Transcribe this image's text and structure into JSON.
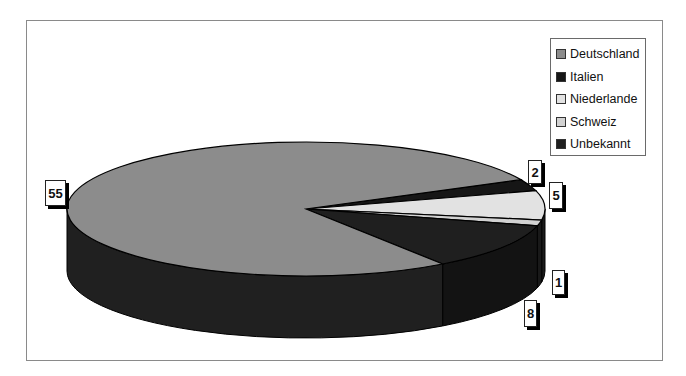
{
  "chart_data": {
    "type": "pie",
    "variant": "3d-pie",
    "title": "",
    "categories": [
      "Deutschland",
      "Italien",
      "Niederlande",
      "Schweiz",
      "Unbekannt"
    ],
    "values": [
      55,
      2,
      5,
      1,
      8
    ],
    "colors": [
      "#8c8c8c",
      "#161616",
      "#e2e2e2",
      "#d2d2d2",
      "#1f1f1f"
    ],
    "data_labels": [
      "55",
      "2",
      "5",
      "1",
      "8"
    ],
    "legend_position": "top-right",
    "grid": false
  },
  "legend": {
    "items": [
      {
        "label": "Deutschland",
        "color": "#8c8c8c"
      },
      {
        "label": "Italien",
        "color": "#161616"
      },
      {
        "label": "Niederlande",
        "color": "#e2e2e2"
      },
      {
        "label": "Schweiz",
        "color": "#d2d2d2"
      },
      {
        "label": "Unbekannt",
        "color": "#1f1f1f"
      }
    ]
  },
  "labels": {
    "deutschland": "55",
    "italien": "2",
    "niederlande": "5",
    "schweiz": "1",
    "unbekannt": "8"
  }
}
